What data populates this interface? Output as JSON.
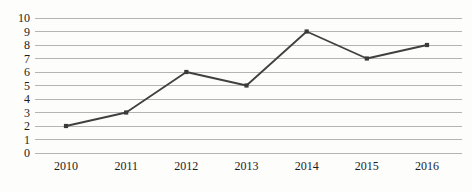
{
  "chart_data": {
    "type": "line",
    "title": "",
    "xlabel": "",
    "ylabel": "",
    "categories": [
      "2010",
      "2011",
      "2012",
      "2013",
      "2014",
      "2015",
      "2016"
    ],
    "values": [
      2,
      3,
      6,
      5,
      9,
      7,
      8
    ],
    "series": [
      {
        "name": "series-1",
        "values": [
          2,
          3,
          6,
          5,
          9,
          7,
          8
        ]
      }
    ],
    "ylim": [
      0,
      10
    ],
    "yticks": [
      0,
      1,
      2,
      3,
      4,
      5,
      6,
      7,
      8,
      9,
      10
    ],
    "ytick_labels": [
      "0",
      "1",
      "2",
      "3",
      "4",
      "5",
      "6",
      "7",
      "8",
      "9",
      "10"
    ],
    "grid": true,
    "grid_axis": "y",
    "legend": false,
    "legend_position": "none",
    "line_color": "#404040",
    "marker": "square",
    "marker_color": "#3a3a3a",
    "grid_color": "#b4b4b4",
    "background_color": "#fdfdfc",
    "text_color": "#1c1c1c"
  },
  "background_artifacts": {
    "bleed_a": "            ",
    "bleed_b": "        ",
    "bleed_c": "         ",
    "bleed_d": "      ",
    "bleed_e": "       "
  }
}
